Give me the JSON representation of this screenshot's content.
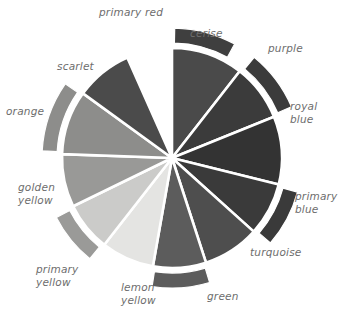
{
  "figure": {
    "kind": "color-wheel",
    "background": "#ffffff",
    "label_color": "#6d6d6d",
    "divider_color": "#ffffff",
    "center": {
      "x": 172,
      "y": 158
    },
    "inner_radius": 0,
    "outer_radius": 110,
    "band_gap": 5,
    "band_width": 15,
    "start_angle_deg": -90,
    "segment_count": 12
  },
  "chart_data": {
    "type": "pie",
    "title": "",
    "xlabel": "",
    "ylabel": "",
    "legend": "none",
    "grid": false,
    "categories": [
      "primary red",
      "cerise",
      "purple",
      "royal blue",
      "primary blue",
      "turquoise",
      "green",
      "lemon yellow",
      "primary yellow",
      "golden yellow",
      "orange",
      "scarlet"
    ],
    "values": [
      30,
      30,
      30,
      30,
      30,
      30,
      30,
      30,
      30,
      30,
      30,
      30
    ],
    "segments": [
      {
        "name": "primary red",
        "index": 0,
        "start_angle": -90,
        "end_angle": -60,
        "fill": "#3f3f3f",
        "has_outer_band": true,
        "band_fill": "#3f3f3f"
      },
      {
        "name": "cerise",
        "index": 1,
        "start_angle": -90,
        "end_angle": -52,
        "fill": "#4a4a4a",
        "has_outer_band": false,
        "band_fill": "#4a4a4a"
      },
      {
        "name": "purple",
        "index": 2,
        "start_angle": -52,
        "end_angle": -22,
        "fill": "#3b3b3b",
        "has_outer_band": true,
        "band_fill": "#3b3b3b"
      },
      {
        "name": "royal blue",
        "index": 3,
        "start_angle": -22,
        "end_angle": 14,
        "fill": "#333333",
        "has_outer_band": false,
        "band_fill": "#333333"
      },
      {
        "name": "primary blue",
        "index": 4,
        "start_angle": 14,
        "end_angle": 42,
        "fill": "#3a3a3a",
        "has_outer_band": true,
        "band_fill": "#3a3a3a"
      },
      {
        "name": "turquoise",
        "index": 5,
        "start_angle": 42,
        "end_angle": 72,
        "fill": "#4e4e4e",
        "has_outer_band": false,
        "band_fill": "#4e4e4e"
      },
      {
        "name": "green",
        "index": 6,
        "start_angle": 72,
        "end_angle": 100,
        "fill": "#5c5c5c",
        "has_outer_band": true,
        "band_fill": "#5c5c5c"
      },
      {
        "name": "lemon yellow",
        "index": 7,
        "start_angle": 100,
        "end_angle": 128,
        "fill": "#e4e4e2",
        "has_outer_band": false,
        "band_fill": "#e4e4e2"
      },
      {
        "name": "primary yellow",
        "index": 8,
        "start_angle": 128,
        "end_angle": 154,
        "fill": "#cbcbc9",
        "has_outer_band": true,
        "band_fill": "#9a9a98"
      },
      {
        "name": "golden yellow",
        "index": 9,
        "start_angle": 154,
        "end_angle": 182,
        "fill": "#999997",
        "has_outer_band": false,
        "band_fill": "#999997"
      },
      {
        "name": "orange",
        "index": 10,
        "start_angle": 182,
        "end_angle": 216,
        "fill": "#8d8d8b",
        "has_outer_band": true,
        "band_fill": "#8d8d8b"
      },
      {
        "name": "scarlet",
        "index": 11,
        "start_angle": 216,
        "end_angle": 246,
        "fill": "#4b4b4b",
        "has_outer_band": false,
        "band_fill": "#4b4b4b"
      }
    ]
  },
  "labels": [
    {
      "id": "primary-red",
      "text": "primary red",
      "x": 99,
      "y": 6,
      "width": 88,
      "align": "left"
    },
    {
      "id": "cerise",
      "text": "cerise",
      "x": 190,
      "y": 27,
      "width": 60,
      "align": "left"
    },
    {
      "id": "purple",
      "text": "purple",
      "x": 268,
      "y": 42,
      "width": 62,
      "align": "left"
    },
    {
      "id": "royal-blue",
      "text": "royal\nblue",
      "x": 290,
      "y": 100,
      "width": 56,
      "align": "left"
    },
    {
      "id": "primary-blue",
      "text": "primary\nblue",
      "x": 295,
      "y": 190,
      "width": 55,
      "align": "left"
    },
    {
      "id": "turquoise",
      "text": "turquoise",
      "x": 250,
      "y": 246,
      "width": 70,
      "align": "left"
    },
    {
      "id": "green",
      "text": "green",
      "x": 207,
      "y": 290,
      "width": 50,
      "align": "left"
    },
    {
      "id": "lemon-yellow",
      "text": "lemon\nyellow",
      "x": 121,
      "y": 281,
      "width": 56,
      "align": "left"
    },
    {
      "id": "primary-yellow",
      "text": "primary\nyellow",
      "x": 36,
      "y": 263,
      "width": 66,
      "align": "left"
    },
    {
      "id": "golden-yellow",
      "text": "golden\nyellow",
      "x": 18,
      "y": 181,
      "width": 60,
      "align": "left"
    },
    {
      "id": "orange",
      "text": "orange",
      "x": 6,
      "y": 105,
      "width": 60,
      "align": "left"
    },
    {
      "id": "scarlet",
      "text": "scarlet",
      "x": 57,
      "y": 60,
      "width": 60,
      "align": "left"
    }
  ]
}
